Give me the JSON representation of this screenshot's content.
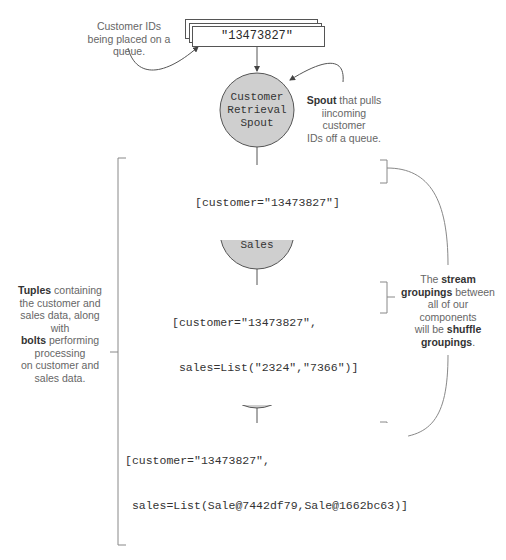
{
  "diagram": {
    "queue": {
      "value": "\"13473827\"",
      "annotation": "Customer IDs being placed on a queue."
    },
    "nodes": [
      {
        "id": "spout",
        "label_lines": [
          "Customer",
          "Retrieval",
          "Spout"
        ],
        "type": "spout"
      },
      {
        "id": "find",
        "label_lines": [
          "Find",
          "Recommended",
          "Sales"
        ],
        "type": "bolt"
      },
      {
        "id": "lookup",
        "label_lines": [
          "Lookup",
          "Sales",
          "Details"
        ],
        "type": "bolt"
      },
      {
        "id": "save",
        "label_lines": [
          "Save",
          "Recommended",
          "Sales"
        ],
        "type": "bolt"
      }
    ],
    "tuples": [
      {
        "lines": [
          "[customer=\"13473827\"]"
        ]
      },
      {
        "lines": [
          "[customer=\"13473827\",",
          " sales=List(\"2324\",\"7366\")]"
        ]
      },
      {
        "lines": [
          "[customer=\"13473827\",",
          " sales=List(Sale@7442df79,Sale@1662bc63)]"
        ]
      }
    ],
    "annotations": {
      "spout": {
        "bold": "Spout",
        "rest_line1": " that pulls",
        "line2": "iincoming customer",
        "line3": "IDs off a queue."
      },
      "tuples_bolts": {
        "bold1": "Tuples",
        "text1": " containing",
        "line2": "the customer and",
        "line3": "sales data, along with",
        "bold2": "bolts",
        "text2": " performing",
        "line5": "processing",
        "line6": "on customer and",
        "line7": "sales data."
      },
      "groupings": {
        "text1": "The ",
        "bold1": "stream",
        "bold2": "groupings",
        "text2": " between",
        "line3": "all of our components",
        "text3": "will be ",
        "bold3": "shuffle",
        "bold4": "groupings",
        "text4": "."
      }
    },
    "colors": {
      "node_fill": "#cfcfcf",
      "stroke": "#555555",
      "bracket": "#888888"
    }
  }
}
